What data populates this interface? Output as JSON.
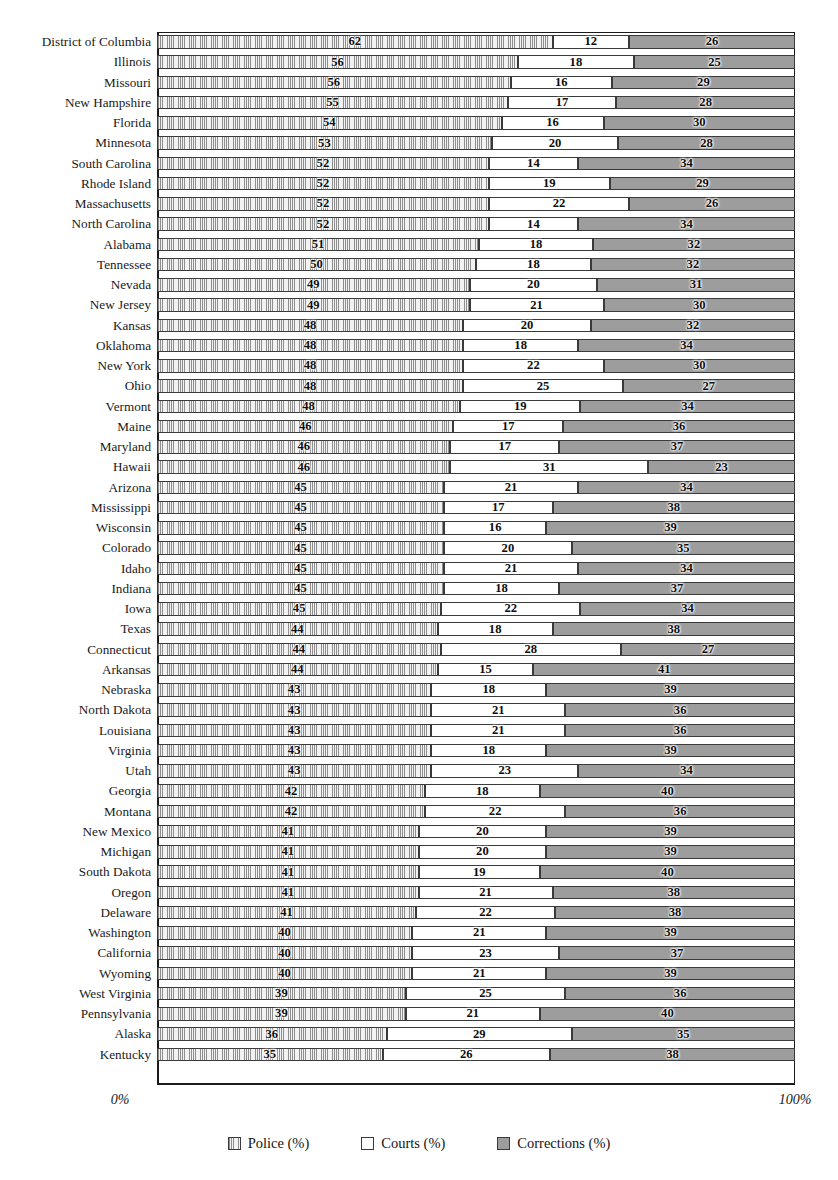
{
  "chart_data": {
    "type": "bar",
    "orientation": "horizontal",
    "stacked": true,
    "normalized": true,
    "title": "",
    "xlabel": "",
    "ylabel": "",
    "xlim": [
      0,
      100
    ],
    "grid": false,
    "legend_position": "bottom",
    "axis_ticks": [
      "0%",
      "100%"
    ],
    "series": [
      {
        "name": "Police (%)",
        "key": "police",
        "pattern": "vertical-hatch",
        "color": "#dedede"
      },
      {
        "name": "Courts (%)",
        "key": "courts",
        "pattern": "solid",
        "color": "#ffffff"
      },
      {
        "name": "Corrections (%)",
        "key": "corrections",
        "pattern": "solid",
        "color": "#9d9d9d"
      }
    ],
    "categories": [
      "District of Columbia",
      "Illinois",
      "Missouri",
      "New Hampshire",
      "Florida",
      "Minnesota",
      "South Carolina",
      "Rhode Island",
      "Massachusetts",
      "North Carolina",
      "Alabama",
      "Tennessee",
      "Nevada",
      "New Jersey",
      "Kansas",
      "Oklahoma",
      "New York",
      "Ohio",
      "Vermont",
      "Maine",
      "Maryland",
      "Hawaii",
      "Arizona",
      "Mississippi",
      "Wisconsin",
      "Colorado",
      "Idaho",
      "Indiana",
      "Iowa",
      "Texas",
      "Connecticut",
      "Arkansas",
      "Nebraska",
      "North Dakota",
      "Louisiana",
      "Virginia",
      "Utah",
      "Georgia",
      "Montana",
      "New Mexico",
      "Michigan",
      "South Dakota",
      "Oregon",
      "Delaware",
      "Washington",
      "California",
      "Wyoming",
      "West Virginia",
      "Pennsylvania",
      "Alaska",
      "Kentucky"
    ],
    "rows": [
      {
        "label": "District of Columbia",
        "police": 62,
        "courts": 12,
        "corrections": 26
      },
      {
        "label": "Illinois",
        "police": 56,
        "courts": 18,
        "corrections": 25
      },
      {
        "label": "Missouri",
        "police": 56,
        "courts": 16,
        "corrections": 29
      },
      {
        "label": "New Hampshire",
        "police": 55,
        "courts": 17,
        "corrections": 28
      },
      {
        "label": "Florida",
        "police": 54,
        "courts": 16,
        "corrections": 30
      },
      {
        "label": "Minnesota",
        "police": 53,
        "courts": 20,
        "corrections": 28
      },
      {
        "label": "South Carolina",
        "police": 52,
        "courts": 14,
        "corrections": 34
      },
      {
        "label": "Rhode Island",
        "police": 52,
        "courts": 19,
        "corrections": 29
      },
      {
        "label": "Massachusetts",
        "police": 52,
        "courts": 22,
        "corrections": 26
      },
      {
        "label": "North Carolina",
        "police": 52,
        "courts": 14,
        "corrections": 34
      },
      {
        "label": "Alabama",
        "police": 51,
        "courts": 18,
        "corrections": 32
      },
      {
        "label": "Tennessee",
        "police": 50,
        "courts": 18,
        "corrections": 32
      },
      {
        "label": "Nevada",
        "police": 49,
        "courts": 20,
        "corrections": 31
      },
      {
        "label": "New Jersey",
        "police": 49,
        "courts": 21,
        "corrections": 30
      },
      {
        "label": "Kansas",
        "police": 48,
        "courts": 20,
        "corrections": 32
      },
      {
        "label": "Oklahoma",
        "police": 48,
        "courts": 18,
        "corrections": 34
      },
      {
        "label": "New York",
        "police": 48,
        "courts": 22,
        "corrections": 30
      },
      {
        "label": "Ohio",
        "police": 48,
        "courts": 25,
        "corrections": 27
      },
      {
        "label": "Vermont",
        "police": 48,
        "courts": 19,
        "corrections": 34
      },
      {
        "label": "Maine",
        "police": 46,
        "courts": 17,
        "corrections": 36
      },
      {
        "label": "Maryland",
        "police": 46,
        "courts": 17,
        "corrections": 37
      },
      {
        "label": "Hawaii",
        "police": 46,
        "courts": 31,
        "corrections": 23
      },
      {
        "label": "Arizona",
        "police": 45,
        "courts": 21,
        "corrections": 34
      },
      {
        "label": "Mississippi",
        "police": 45,
        "courts": 17,
        "corrections": 38
      },
      {
        "label": "Wisconsin",
        "police": 45,
        "courts": 16,
        "corrections": 39
      },
      {
        "label": "Colorado",
        "police": 45,
        "courts": 20,
        "corrections": 35
      },
      {
        "label": "Idaho",
        "police": 45,
        "courts": 21,
        "corrections": 34
      },
      {
        "label": "Indiana",
        "police": 45,
        "courts": 18,
        "corrections": 37
      },
      {
        "label": "Iowa",
        "police": 45,
        "courts": 22,
        "corrections": 34
      },
      {
        "label": "Texas",
        "police": 44,
        "courts": 18,
        "corrections": 38
      },
      {
        "label": "Connecticut",
        "police": 44,
        "courts": 28,
        "corrections": 27
      },
      {
        "label": "Arkansas",
        "police": 44,
        "courts": 15,
        "corrections": 41
      },
      {
        "label": "Nebraska",
        "police": 43,
        "courts": 18,
        "corrections": 39
      },
      {
        "label": "North Dakota",
        "police": 43,
        "courts": 21,
        "corrections": 36
      },
      {
        "label": "Louisiana",
        "police": 43,
        "courts": 21,
        "corrections": 36
      },
      {
        "label": "Virginia",
        "police": 43,
        "courts": 18,
        "corrections": 39
      },
      {
        "label": "Utah",
        "police": 43,
        "courts": 23,
        "corrections": 34
      },
      {
        "label": "Georgia",
        "police": 42,
        "courts": 18,
        "corrections": 40
      },
      {
        "label": "Montana",
        "police": 42,
        "courts": 22,
        "corrections": 36
      },
      {
        "label": "New Mexico",
        "police": 41,
        "courts": 20,
        "corrections": 39
      },
      {
        "label": "Michigan",
        "police": 41,
        "courts": 20,
        "corrections": 39
      },
      {
        "label": "South Dakota",
        "police": 41,
        "courts": 19,
        "corrections": 40
      },
      {
        "label": "Oregon",
        "police": 41,
        "courts": 21,
        "corrections": 38
      },
      {
        "label": "Delaware",
        "police": 41,
        "courts": 22,
        "corrections": 38
      },
      {
        "label": "Washington",
        "police": 40,
        "courts": 21,
        "corrections": 39
      },
      {
        "label": "California",
        "police": 40,
        "courts": 23,
        "corrections": 37
      },
      {
        "label": "Wyoming",
        "police": 40,
        "courts": 21,
        "corrections": 39
      },
      {
        "label": "West Virginia",
        "police": 39,
        "courts": 25,
        "corrections": 36
      },
      {
        "label": "Pennsylvania",
        "police": 39,
        "courts": 21,
        "corrections": 40
      },
      {
        "label": "Alaska",
        "police": 36,
        "courts": 29,
        "corrections": 35
      },
      {
        "label": "Kentucky",
        "police": 35,
        "courts": 26,
        "corrections": 38
      }
    ]
  },
  "axis": {
    "left_tick": "0%",
    "right_tick": "100%"
  },
  "legend": {
    "items": [
      {
        "label": "Police (%)",
        "swatch": "police-swatch-icon"
      },
      {
        "label": "Courts (%)",
        "swatch": "courts-swatch-icon"
      },
      {
        "label": "Corrections (%)",
        "swatch": "corrections-swatch-icon"
      }
    ]
  }
}
